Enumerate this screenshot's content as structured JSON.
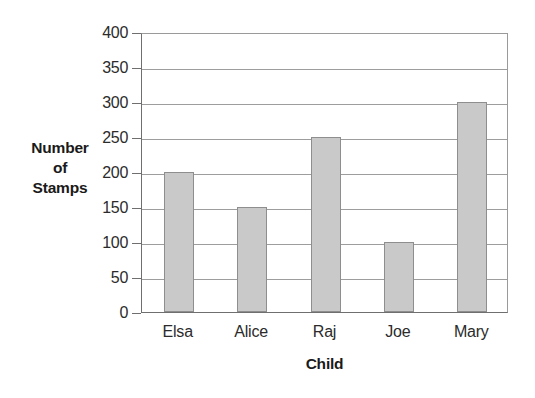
{
  "chart_data": {
    "type": "bar",
    "title": "",
    "subtitle": "",
    "categories": [
      "Elsa",
      "Alice",
      "Raj",
      "Joe",
      "Mary"
    ],
    "values": [
      200,
      150,
      250,
      100,
      300
    ],
    "series": [
      {
        "name": "Number of Stamps",
        "values": [
          200,
          150,
          250,
          100,
          300
        ]
      }
    ],
    "xlabel": "Child",
    "ylabel": "Number of Stamps",
    "ylabel_lines": [
      "Number",
      "of",
      "Stamps"
    ],
    "ylim": [
      0,
      400
    ],
    "ytick_step": 50,
    "yticks": [
      0,
      50,
      100,
      150,
      200,
      250,
      300,
      350,
      400
    ],
    "ytick_labels": [
      "0",
      "50",
      "100",
      "150",
      "200",
      "250",
      "300",
      "350",
      "400"
    ],
    "grid": true,
    "grid_axis": "y",
    "legend": false,
    "legend_position": "none",
    "annotations": [],
    "colors": {
      "bar_fill": "#c9c9c9",
      "bar_border": "#8e8e8e",
      "gridline": "#9d9d9d",
      "axis": "#6f6f6f",
      "text": "#2b2b2b",
      "title_text": "#1a1a1a",
      "background": "#ffffff"
    }
  }
}
